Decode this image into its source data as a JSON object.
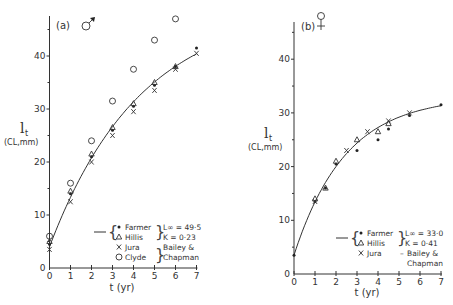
{
  "figure": {
    "panels": [
      {
        "label": "(a)",
        "sex_symbol": "male-symbol",
        "xlabel": "t (yr)",
        "ylabel_main": "l",
        "ylabel_sub": "t",
        "ylabel_units": "(CL,mm)",
        "legend": {
          "rows": [
            {
              "marker": "•",
              "name": "Farmer"
            },
            {
              "marker": "Δ",
              "name": "Hillis"
            },
            {
              "marker": "X",
              "name": "Jura"
            },
            {
              "marker": "O",
              "name": "Clyde"
            }
          ],
          "param_linf": "L∞ = 49·5",
          "param_k": "K  = 0·23",
          "source_1": "Bailey &",
          "source_2": "Chapman"
        }
      },
      {
        "label": "(b)",
        "sex_symbol": "female-symbol",
        "xlabel": "t (yr)",
        "ylabel_main": "l",
        "ylabel_sub": "t",
        "ylabel_units": "(CL,mm)",
        "legend": {
          "rows": [
            {
              "marker": "•",
              "name": "Farmer"
            },
            {
              "marker": "Δ",
              "name": "Hillis"
            },
            {
              "marker": "X",
              "name": "Jura"
            }
          ],
          "param_linf": "L∞ = 33·0",
          "param_k": "K  = 0·41",
          "source_dash": "–",
          "source_1": "Bailey &",
          "source_2": "Chapman"
        }
      }
    ],
    "x_ticks": [
      "0",
      "1",
      "2",
      "3",
      "4",
      "5",
      "6",
      "7"
    ],
    "y_ticks": [
      "0",
      "10",
      "20",
      "30",
      "40"
    ]
  },
  "chart_data": [
    {
      "type": "scatter",
      "title": "(a) ♂",
      "xlabel": "t (yr)",
      "ylabel": "l_t (CL, mm)",
      "xlim": [
        0,
        7
      ],
      "ylim": [
        0,
        47
      ],
      "grid": false,
      "legend_position": "lower right",
      "fit": {
        "model": "von Bertalanffy",
        "Linf": 49.5,
        "K": 0.23,
        "L0": 4.0,
        "applies_to": [
          "Farmer",
          "Hillis"
        ]
      },
      "series": [
        {
          "name": "Farmer",
          "marker": "filled-dot",
          "x": [
            0,
            1,
            2,
            3,
            4,
            5,
            6,
            7
          ],
          "y": [
            4.5,
            14,
            21,
            26,
            30.5,
            34.5,
            38,
            41.5
          ]
        },
        {
          "name": "Hillis",
          "marker": "triangle",
          "x": [
            0,
            1,
            2,
            3,
            4,
            5,
            6
          ],
          "y": [
            5,
            14.5,
            21.5,
            26.5,
            31,
            35,
            38
          ]
        },
        {
          "name": "Jura",
          "marker": "x",
          "x": [
            0,
            1,
            2,
            3,
            4,
            5,
            6,
            7
          ],
          "y": [
            3.5,
            12.5,
            20,
            25,
            29.5,
            33.5,
            37.5,
            40.5
          ]
        },
        {
          "name": "Clyde",
          "marker": "open-circle",
          "x": [
            0,
            1,
            2,
            3,
            4,
            5,
            6
          ],
          "y": [
            6,
            16,
            24,
            31.5,
            37.5,
            43,
            47
          ]
        }
      ]
    },
    {
      "type": "scatter",
      "title": "(b) ♀",
      "xlabel": "t (yr)",
      "ylabel": "l_t (CL, mm)",
      "xlim": [
        0,
        7
      ],
      "ylim": [
        0,
        47
      ],
      "grid": false,
      "legend_position": "lower right",
      "fit": {
        "model": "von Bertalanffy",
        "Linf": 33.0,
        "K": 0.41,
        "L0": 3.5,
        "applies_to": [
          "Farmer",
          "Hillis"
        ]
      },
      "series": [
        {
          "name": "Farmer",
          "marker": "filled-dot",
          "x": [
            0,
            1,
            1.5,
            2,
            3,
            4,
            4.5,
            5.5,
            7
          ],
          "y": [
            3.5,
            13.5,
            16,
            20.5,
            23,
            25,
            27,
            29.5,
            31.5
          ]
        },
        {
          "name": "Hillis",
          "marker": "triangle",
          "x": [
            1,
            1.5,
            2,
            3,
            4,
            4.5
          ],
          "y": [
            14,
            16,
            21,
            25,
            26.5,
            28
          ]
        },
        {
          "name": "Jura",
          "marker": "x",
          "x": [
            1,
            2.5,
            3.5,
            4.5,
            5.5
          ],
          "y": [
            13.5,
            23,
            26.5,
            28.5,
            30
          ]
        }
      ]
    }
  ]
}
